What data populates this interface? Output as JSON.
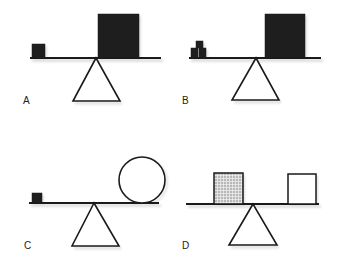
{
  "figure": {
    "panels": [
      {
        "label": "A",
        "label_pos": [
          23,
          96
        ],
        "beam": {
          "x1": 30,
          "x2": 161,
          "y": 58
        },
        "fulcrum": {
          "apex": [
            96,
            58
          ],
          "base_left": [
            73,
            101
          ],
          "base_right": [
            120,
            101
          ]
        },
        "objects": [
          {
            "shape": "square",
            "fill": "dark",
            "x": 32,
            "y": 44,
            "w": 13,
            "h": 14,
            "desc": "small dark block"
          },
          {
            "shape": "square",
            "fill": "dark",
            "x": 98,
            "y": 14,
            "w": 41,
            "h": 44,
            "desc": "large dark block"
          }
        ]
      },
      {
        "label": "B",
        "label_pos": [
          182,
          96
        ],
        "beam": {
          "x1": 189,
          "x2": 321,
          "y": 58
        },
        "fulcrum": {
          "apex": [
            256,
            58
          ],
          "base_left": [
            232,
            100
          ],
          "base_right": [
            279,
            100
          ]
        },
        "objects": [
          {
            "shape": "square",
            "fill": "dark",
            "x": 191,
            "y": 48,
            "w": 7,
            "h": 10,
            "desc": "small dark block (bottom left)"
          },
          {
            "shape": "square",
            "fill": "dark",
            "x": 199,
            "y": 48,
            "w": 7,
            "h": 10,
            "desc": "small dark block (bottom right)"
          },
          {
            "shape": "square",
            "fill": "dark",
            "x": 196,
            "y": 41,
            "w": 7,
            "h": 7,
            "desc": "small dark block (top)"
          },
          {
            "shape": "square",
            "fill": "dark",
            "x": 265,
            "y": 14,
            "w": 40,
            "h": 44,
            "desc": "large dark block"
          }
        ]
      },
      {
        "label": "C",
        "label_pos": [
          24,
          241
        ],
        "beam": {
          "x1": 29,
          "x2": 159,
          "y": 203
        },
        "fulcrum": {
          "apex": [
            94,
            203
          ],
          "base_left": [
            72,
            246
          ],
          "base_right": [
            119,
            246
          ]
        },
        "objects": [
          {
            "shape": "square",
            "fill": "dark",
            "x": 32,
            "y": 193,
            "w": 10,
            "h": 10,
            "desc": "small dark block"
          },
          {
            "shape": "circle",
            "fill": "white",
            "cx": 142,
            "cy": 180,
            "r": 23,
            "desc": "large hollow circle"
          }
        ]
      },
      {
        "label": "D",
        "label_pos": [
          182,
          241
        ],
        "beam": {
          "x1": 186,
          "x2": 319,
          "y": 204
        },
        "fulcrum": {
          "apex": [
            253,
            204
          ],
          "base_left": [
            229,
            245
          ],
          "base_right": [
            277,
            245
          ]
        },
        "objects": [
          {
            "shape": "square",
            "fill": "hatched",
            "x": 214,
            "y": 173,
            "w": 29,
            "h": 31,
            "desc": "gray crosshatched block"
          },
          {
            "shape": "square",
            "fill": "white",
            "x": 288,
            "y": 174,
            "w": 28,
            "h": 30,
            "desc": "white hollow block"
          }
        ]
      }
    ],
    "colors": {
      "dark": "#1e1e1e",
      "line": "#1a1a1a",
      "hatch_bg": "#b8b8b8",
      "hatch_line": "#e8e8e8",
      "white": "#ffffff",
      "shadow": "#c8c8c8"
    }
  }
}
